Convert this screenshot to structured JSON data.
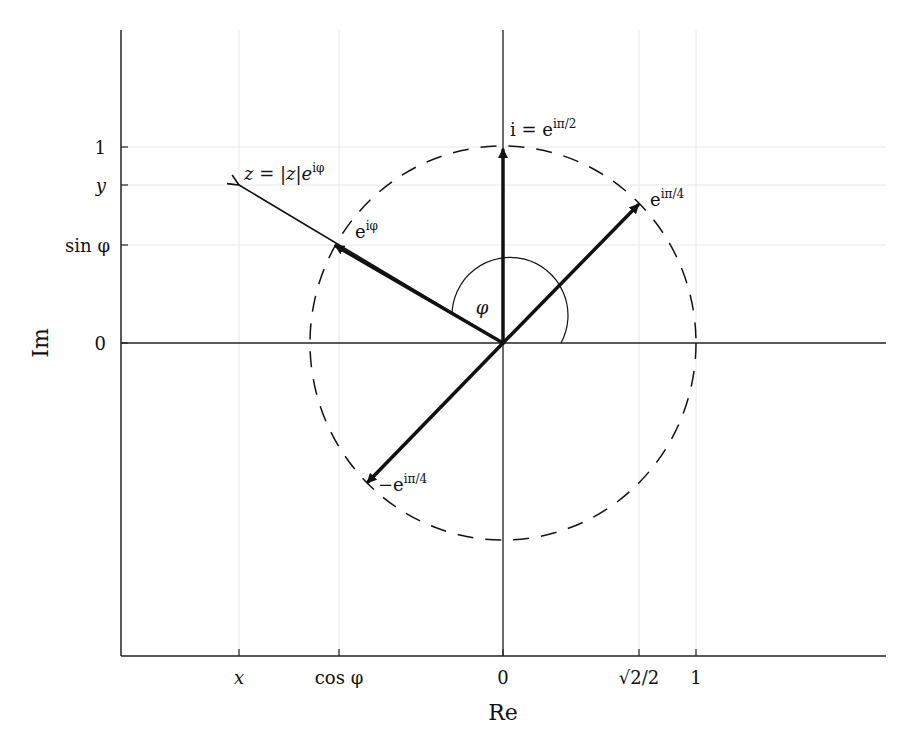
{
  "figure": {
    "type": "complex-plane-diagram",
    "xlabel": "Re",
    "ylabel": "Im",
    "x_ticks": [
      {
        "label": "x",
        "value": "x"
      },
      {
        "label": "cos φ",
        "value": "cos φ"
      },
      {
        "label": "0",
        "value": 0
      },
      {
        "label": "√2/2",
        "value": 0.7071
      },
      {
        "label": "1",
        "value": 1
      }
    ],
    "y_ticks": [
      {
        "label": "1",
        "value": 1
      },
      {
        "label": "y",
        "value": "y"
      },
      {
        "label": "sin φ",
        "value": "sin φ"
      },
      {
        "label": "0",
        "value": 0
      }
    ],
    "unit_circle": {
      "style": "dashed",
      "radius": 1
    },
    "vectors": [
      {
        "name": "i",
        "label": "i = e^{iπ/2}",
        "label_text": "i = e",
        "label_sup": "iπ/2",
        "to": [
          0,
          1
        ],
        "weight": "bold"
      },
      {
        "name": "e-ipi4",
        "label": "e^{iπ/4}",
        "label_text": "e",
        "label_sup": "iπ/4",
        "to": [
          0.7071,
          0.7071
        ],
        "weight": "bold"
      },
      {
        "name": "neg-e-ipi4",
        "label": "−e^{iπ/4}",
        "label_text": "−e",
        "label_sup": "iπ/4",
        "to": [
          -0.7071,
          -0.7071
        ],
        "weight": "bold"
      },
      {
        "name": "e-iphi",
        "label": "e^{iφ}",
        "label_text": "e",
        "label_sup": "iφ",
        "to": [
          "cos φ",
          "sin φ"
        ],
        "weight": "bold"
      },
      {
        "name": "z",
        "label": "z = |z|e^{iφ}",
        "label_text": "z = |z|e",
        "label_sup": "iφ",
        "to": [
          "x",
          "y"
        ],
        "weight": "thin"
      }
    ],
    "angle_label": "φ"
  }
}
